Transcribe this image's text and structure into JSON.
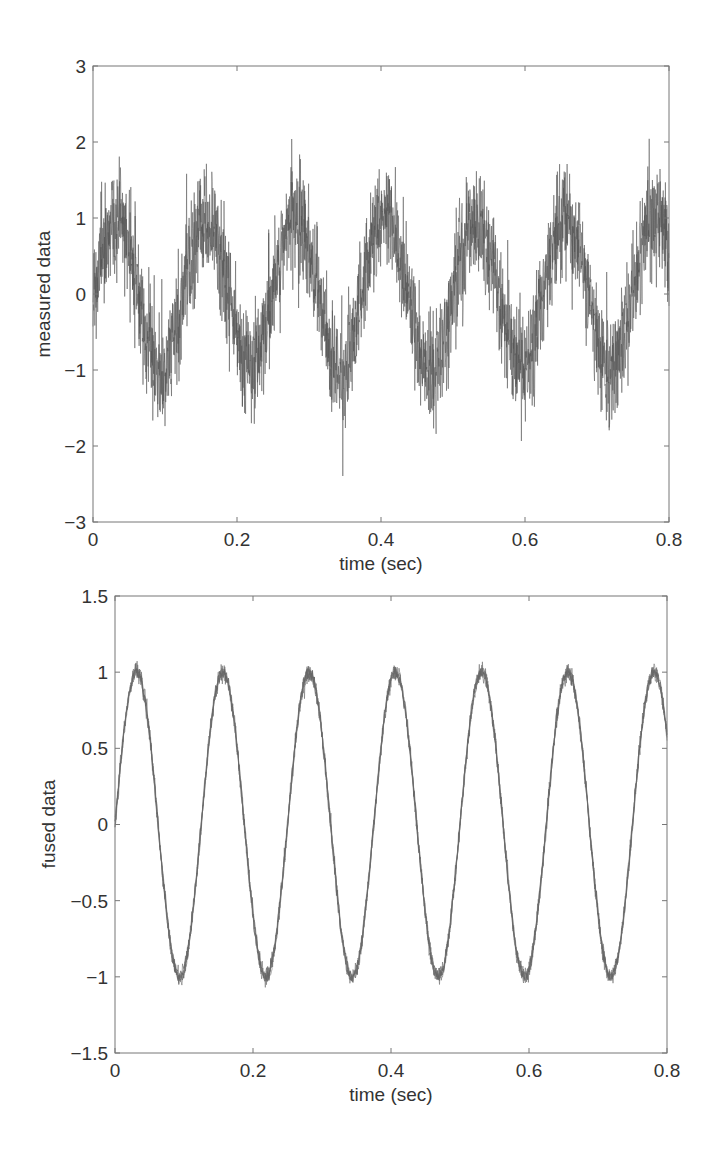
{
  "chart_data": [
    {
      "type": "line",
      "title": "",
      "xlabel": "time (sec)",
      "ylabel": "measured data",
      "xlim": [
        0,
        0.8
      ],
      "ylim": [
        -3,
        3
      ],
      "xticks": [
        0,
        0.2,
        0.4,
        0.6,
        0.8
      ],
      "xtick_labels": [
        "0",
        "0.2",
        "0.4",
        "0.6",
        "0.8"
      ],
      "yticks": [
        -3,
        -2,
        -1,
        0,
        1,
        2,
        3
      ],
      "ytick_labels": [
        "−3",
        "−2",
        "−1",
        "0",
        "1",
        "2",
        "3"
      ],
      "grid": false,
      "legend": null,
      "series": [
        {
          "name": "measured data (noisy sine)",
          "description": "sine wave of ~8 Hz, amplitude ~1, with heavy additive noise (band roughly ±0.7, spikes up to ±2.2)",
          "frequency_hz": 8,
          "amplitude": 1.0,
          "noise_std": 0.35,
          "color": "#555555",
          "approx_peaks": [
            {
              "t": 0.03,
              "y": 1.6
            },
            {
              "t": 0.155,
              "y": 1.6
            },
            {
              "t": 0.28,
              "y": 1.7
            },
            {
              "t": 0.405,
              "y": 1.7
            },
            {
              "t": 0.53,
              "y": 1.6
            },
            {
              "t": 0.655,
              "y": 1.6
            },
            {
              "t": 0.78,
              "y": 1.6
            }
          ],
          "approx_troughs": [
            {
              "t": 0.095,
              "y": -1.7
            },
            {
              "t": 0.22,
              "y": -1.7
            },
            {
              "t": 0.345,
              "y": -1.6
            },
            {
              "t": 0.47,
              "y": -1.7
            },
            {
              "t": 0.595,
              "y": -1.7
            },
            {
              "t": 0.72,
              "y": -1.7
            }
          ]
        }
      ]
    },
    {
      "type": "line",
      "title": "",
      "xlabel": "time (sec)",
      "ylabel": "fused data",
      "xlim": [
        0,
        0.8
      ],
      "ylim": [
        -1.5,
        1.5
      ],
      "xticks": [
        0,
        0.2,
        0.4,
        0.6,
        0.8
      ],
      "xtick_labels": [
        "0",
        "0.2",
        "0.4",
        "0.6",
        "0.8"
      ],
      "yticks": [
        -1.5,
        -1,
        -0.5,
        0,
        0.5,
        1,
        1.5
      ],
      "ytick_labels": [
        "−1.5",
        "−1",
        "−0.5",
        "0",
        "0.5",
        "1",
        "1.5"
      ],
      "grid": false,
      "legend": null,
      "series": [
        {
          "name": "fused data (filtered sine)",
          "description": "clean sine wave of ~8 Hz, amplitude ~1, small residual noise (±0.05)",
          "frequency_hz": 8,
          "amplitude": 1.0,
          "noise_std": 0.025,
          "color": "#666666",
          "approx_peaks": [
            {
              "t": 0.038,
              "y": 1.0
            },
            {
              "t": 0.163,
              "y": 1.0
            },
            {
              "t": 0.288,
              "y": 1.0
            },
            {
              "t": 0.413,
              "y": 1.0
            },
            {
              "t": 0.538,
              "y": 1.0
            },
            {
              "t": 0.663,
              "y": 1.0
            },
            {
              "t": 0.788,
              "y": 1.0
            }
          ],
          "approx_troughs": [
            {
              "t": 0.1,
              "y": -1.0
            },
            {
              "t": 0.225,
              "y": -1.0
            },
            {
              "t": 0.35,
              "y": -1.0
            },
            {
              "t": 0.475,
              "y": -1.0
            },
            {
              "t": 0.6,
              "y": -1.0
            },
            {
              "t": 0.725,
              "y": -1.0
            }
          ]
        }
      ]
    }
  ],
  "plots": {
    "top": {
      "ylabel": "measured data",
      "xlabel": "time (sec)",
      "xtick_labels": [
        "0",
        "0.2",
        "0.4",
        "0.6",
        "0.8"
      ],
      "ytick_labels": [
        "3",
        "2",
        "1",
        "0",
        "−1",
        "−2",
        "−3"
      ]
    },
    "bottom": {
      "ylabel": "fused data",
      "xlabel": "time (sec)",
      "xtick_labels": [
        "0",
        "0.2",
        "0.4",
        "0.6",
        "0.8"
      ],
      "ytick_labels": [
        "1.5",
        "1",
        "0.5",
        "0",
        "−0.5",
        "−1",
        "−1.5"
      ]
    }
  }
}
